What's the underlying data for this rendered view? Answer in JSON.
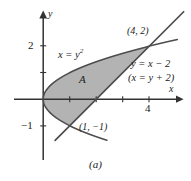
{
  "figure": {
    "caption": "(a)",
    "region_label": "A",
    "axis_labels": {
      "x": "x",
      "y": "y"
    },
    "tick_labels": {
      "y_two": "2",
      "y_minus_one": "−1",
      "x_four": "4"
    },
    "annotations": {
      "parabola": "x = y",
      "parabola_exponent": "2",
      "line_primary": "y = x − 2",
      "line_secondary": "(x = y + 2)",
      "point_upper": "(4, 2)",
      "point_lower": "(1, −1)"
    },
    "colors": {
      "shade_fill": "#b3b3b3",
      "curve_stroke": "#4d4d4d",
      "axis_stroke": "#333333",
      "text": "#1a1a1a",
      "background": "#ffffff"
    }
  },
  "chart_data": {
    "type": "area",
    "title": "",
    "subtitle": "(a)",
    "xlabel": "x",
    "ylabel": "y",
    "xlim": [
      -0.6,
      5.4
    ],
    "ylim": [
      -2.1,
      2.9
    ],
    "grid": false,
    "legend": "none",
    "x_ticks": [
      1,
      2,
      3,
      4
    ],
    "x_tick_labels": [
      "",
      "",
      "",
      "4"
    ],
    "y_ticks": [
      -1,
      1,
      2
    ],
    "y_tick_labels": [
      "−1",
      "",
      "2"
    ],
    "series": [
      {
        "name": "x = y^2",
        "type": "curve",
        "equation": "x = y^2",
        "label": "x = y²",
        "y_domain": [
          -1.55,
          2.25
        ],
        "points": [
          {
            "x": 2.4,
            "y": -1.55
          },
          {
            "x": 1.69,
            "y": -1.3
          },
          {
            "x": 1.0,
            "y": -1.0
          },
          {
            "x": 0.56,
            "y": -0.75
          },
          {
            "x": 0.25,
            "y": -0.5
          },
          {
            "x": 0.0,
            "y": 0.0
          },
          {
            "x": 0.25,
            "y": 0.5
          },
          {
            "x": 1.0,
            "y": 1.0
          },
          {
            "x": 2.25,
            "y": 1.5
          },
          {
            "x": 4.0,
            "y": 2.0
          },
          {
            "x": 5.06,
            "y": 2.25
          }
        ]
      },
      {
        "name": "y = x - 2",
        "type": "line",
        "equation": "y = x - 2",
        "alt_equation": "x = y + 2",
        "label": "y = x − 2",
        "x_domain": [
          0.45,
          5.3
        ],
        "points": [
          {
            "x": 0.45,
            "y": -1.55
          },
          {
            "x": 5.3,
            "y": 3.3
          }
        ]
      }
    ],
    "shaded_region": {
      "name": "A",
      "label": "A",
      "bounded_by": [
        "x = y^2",
        "x = y + 2"
      ],
      "y_range": [
        -1,
        2
      ],
      "area_label_position": {
        "x": 1.35,
        "y": 0.55
      }
    },
    "annotations": [
      {
        "text": "(4, 2)",
        "x": 4.0,
        "y": 2.0,
        "type": "intersection-point"
      },
      {
        "text": "(1, −1)",
        "x": 1.0,
        "y": -1.0,
        "type": "intersection-point"
      },
      {
        "text": "x = y²",
        "x": 1.1,
        "y": 1.45,
        "type": "curve-label"
      },
      {
        "text": "y = x − 2",
        "x": 4.2,
        "y": 1.05,
        "type": "line-label"
      },
      {
        "text": "(x = y + 2)",
        "x": 4.2,
        "y": 0.65,
        "type": "line-label"
      }
    ]
  }
}
